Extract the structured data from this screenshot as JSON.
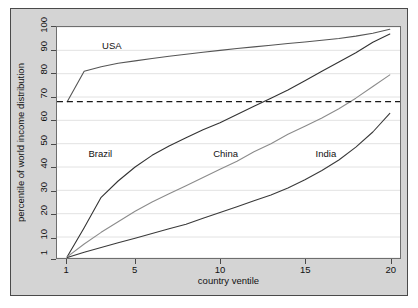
{
  "chart_data": {
    "type": "line",
    "title": "",
    "xlabel": "country ventile",
    "ylabel": "percentile of world income distribution",
    "xlim": [
      0.4,
      20.6
    ],
    "ylim": [
      1,
      100
    ],
    "xticks": [
      1,
      5,
      10,
      15,
      20
    ],
    "yticks": [
      1,
      10,
      20,
      30,
      40,
      50,
      60,
      70,
      80,
      90,
      100
    ],
    "grid": "horizontal",
    "legend": "inline-labels",
    "x": [
      1,
      2,
      3,
      4,
      5,
      6,
      7,
      8,
      9,
      10,
      11,
      12,
      13,
      14,
      15,
      16,
      17,
      18,
      19,
      20
    ],
    "series": [
      {
        "name": "USA",
        "color": "#555555",
        "label_x": 3.1,
        "label_y": 91,
        "values": [
          68,
          81,
          83,
          84.5,
          85.5,
          86.5,
          87.5,
          88.3,
          89.2,
          90,
          90.8,
          91.5,
          92.2,
          92.9,
          93.6,
          94.3,
          95.1,
          96.1,
          97.3,
          99
        ]
      },
      {
        "name": "Brazil",
        "color": "#333333",
        "label_x": 2.3,
        "label_y": 45,
        "values": [
          1.5,
          14,
          27,
          34,
          40,
          45,
          49,
          52.5,
          56,
          59,
          62.5,
          66,
          69.5,
          73,
          77,
          81,
          85,
          89,
          93.5,
          97
        ]
      },
      {
        "name": "China",
        "color": "#8c8c8c",
        "label_x": 9.6,
        "label_y": 45,
        "values": [
          1.5,
          7,
          12,
          16.5,
          21,
          25,
          28.5,
          32,
          35.5,
          39,
          42.5,
          46.5,
          50,
          54,
          57.5,
          61,
          65,
          69.5,
          74.5,
          79.5
        ]
      },
      {
        "name": "India",
        "color": "#3a3a3a",
        "label_x": 15.6,
        "label_y": 45,
        "values": [
          1.2,
          3.5,
          5.5,
          7.5,
          9.5,
          11.5,
          13.5,
          15.5,
          18,
          20.5,
          23,
          25.5,
          28,
          31,
          34.5,
          38.5,
          43,
          48.5,
          55,
          63
        ]
      }
    ],
    "reference_line": {
      "name": "world-median-reference",
      "y": 68,
      "style": "dashed",
      "color": "#1a1a1a"
    }
  }
}
